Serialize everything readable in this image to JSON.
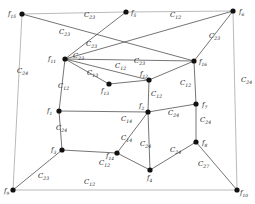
{
  "figure": {
    "kind": "graph-diagram",
    "background": "#ffffff",
    "node_color": "#111111",
    "edge_color": "#3a3a3a",
    "outer_edge_color": "#a8a8a8",
    "width": 255,
    "height": 204
  },
  "vertices": [
    {
      "id": "f15",
      "label": "f",
      "sub": "15",
      "x": 22,
      "y": 14,
      "lx": 8,
      "ly": 16
    },
    {
      "id": "f5",
      "label": "f",
      "sub": "5",
      "x": 126,
      "y": 12,
      "lx": 131,
      "ly": 15
    },
    {
      "id": "f6",
      "label": "f",
      "sub": "6",
      "x": 233,
      "y": 11,
      "lx": 239,
      "ly": 14
    },
    {
      "id": "f11",
      "label": "f",
      "sub": "11",
      "x": 65,
      "y": 59,
      "lx": 48,
      "ly": 61
    },
    {
      "id": "f16",
      "label": "f",
      "sub": "16",
      "x": 194,
      "y": 61,
      "lx": 199,
      "ly": 64
    },
    {
      "id": "f12",
      "label": "f",
      "sub": "12",
      "x": 149,
      "y": 80,
      "lx": 140,
      "ly": 76
    },
    {
      "id": "f13",
      "label": "f",
      "sub": "13",
      "x": 109,
      "y": 84,
      "lx": 101,
      "ly": 93
    },
    {
      "id": "f1",
      "label": "f",
      "sub": "1",
      "x": 59,
      "y": 111,
      "lx": 47,
      "ly": 113
    },
    {
      "id": "f2",
      "label": "f",
      "sub": "2",
      "x": 148,
      "y": 112,
      "lx": 139,
      "ly": 108
    },
    {
      "id": "f7",
      "label": "f",
      "sub": "7",
      "x": 196,
      "y": 104,
      "lx": 202,
      "ly": 107
    },
    {
      "id": "f3",
      "label": "f",
      "sub": "3",
      "x": 62,
      "y": 150,
      "lx": 51,
      "ly": 152
    },
    {
      "id": "f14",
      "label": "f",
      "sub": "14",
      "x": 117,
      "y": 153,
      "lx": 106,
      "ly": 158
    },
    {
      "id": "f8",
      "label": "f",
      "sub": "8",
      "x": 196,
      "y": 142,
      "lx": 202,
      "ly": 145
    },
    {
      "id": "f4",
      "label": "f",
      "sub": "4",
      "x": 150,
      "y": 170,
      "lx": 147,
      "ly": 180
    },
    {
      "id": "f9",
      "label": "f",
      "sub": "9",
      "x": 13,
      "y": 190,
      "lx": 4,
      "ly": 193
    },
    {
      "id": "f10",
      "label": "f",
      "sub": "10",
      "x": 237,
      "y": 190,
      "lx": 240,
      "ly": 195
    }
  ],
  "edges": [
    {
      "from": "f15",
      "to": "f5",
      "style": "light"
    },
    {
      "from": "f5",
      "to": "f6",
      "style": "light"
    },
    {
      "from": "f15",
      "to": "f9",
      "style": "light"
    },
    {
      "from": "f6",
      "to": "f10",
      "style": "light"
    },
    {
      "from": "f9",
      "to": "f10",
      "style": "light"
    },
    {
      "from": "f15",
      "to": "f16",
      "style": "normal"
    },
    {
      "from": "f11",
      "to": "f5",
      "style": "normal"
    },
    {
      "from": "f11",
      "to": "f6",
      "style": "normal"
    },
    {
      "from": "f11",
      "to": "f16",
      "style": "normal"
    },
    {
      "from": "f11",
      "to": "f12",
      "style": "normal"
    },
    {
      "from": "f11",
      "to": "f13",
      "style": "normal"
    },
    {
      "from": "f11",
      "to": "f1",
      "style": "normal"
    },
    {
      "from": "f16",
      "to": "f6",
      "style": "normal"
    },
    {
      "from": "f16",
      "to": "f7",
      "style": "normal"
    },
    {
      "from": "f12",
      "to": "f13",
      "style": "normal"
    },
    {
      "from": "f12",
      "to": "f16",
      "style": "normal"
    },
    {
      "from": "f12",
      "to": "f2",
      "style": "normal"
    },
    {
      "from": "f1",
      "to": "f2",
      "style": "normal"
    },
    {
      "from": "f1",
      "to": "f3",
      "style": "normal"
    },
    {
      "from": "f2",
      "to": "f7",
      "style": "normal"
    },
    {
      "from": "f2",
      "to": "f14",
      "style": "normal"
    },
    {
      "from": "f2",
      "to": "f4",
      "style": "normal"
    },
    {
      "from": "f7",
      "to": "f8",
      "style": "normal"
    },
    {
      "from": "f3",
      "to": "f14",
      "style": "normal"
    },
    {
      "from": "f3",
      "to": "f9",
      "style": "normal"
    },
    {
      "from": "f14",
      "to": "f4",
      "style": "normal"
    },
    {
      "from": "f4",
      "to": "f8",
      "style": "normal"
    },
    {
      "from": "f8",
      "to": "f10",
      "style": "normal"
    }
  ],
  "edge_labels": [
    {
      "id": "c23-top",
      "label": "C",
      "sub": "23",
      "x": 84,
      "y": 17
    },
    {
      "id": "c12-top",
      "label": "C",
      "sub": "12",
      "x": 170,
      "y": 17
    },
    {
      "id": "c23-f11f5",
      "label": "C",
      "sub": "23",
      "x": 59,
      "y": 34
    },
    {
      "id": "c23-diag",
      "label": "C",
      "sub": "23",
      "x": 86,
      "y": 46
    },
    {
      "id": "c23-f16f6",
      "label": "C",
      "sub": "23",
      "x": 209,
      "y": 38
    },
    {
      "id": "c24-left",
      "label": "C",
      "sub": "24",
      "x": 17,
      "y": 73
    },
    {
      "id": "c24-right",
      "label": "C",
      "sub": "24",
      "x": 241,
      "y": 82
    },
    {
      "id": "c23-f11f12",
      "label": "C",
      "sub": "23",
      "x": 73,
      "y": 58
    },
    {
      "id": "c12-f11f12",
      "label": "C",
      "sub": "12",
      "x": 115,
      "y": 68
    },
    {
      "id": "c23-f12b",
      "label": "C",
      "sub": "23",
      "x": 134,
      "y": 63
    },
    {
      "id": "c13-f11f13",
      "label": "C",
      "sub": "13",
      "x": 87,
      "y": 75
    },
    {
      "id": "c12-f11f1",
      "label": "C",
      "sub": "12",
      "x": 58,
      "y": 88
    },
    {
      "id": "c12-f16f7",
      "label": "C",
      "sub": "12",
      "x": 180,
      "y": 85
    },
    {
      "id": "c12-f12f2",
      "label": "C",
      "sub": "12",
      "x": 151,
      "y": 96
    },
    {
      "id": "c24-f1f3",
      "label": "C",
      "sub": "24",
      "x": 56,
      "y": 130
    },
    {
      "id": "c14-f2",
      "label": "C",
      "sub": "14",
      "x": 121,
      "y": 121
    },
    {
      "id": "c24-f2f7",
      "label": "C",
      "sub": "24",
      "x": 168,
      "y": 115
    },
    {
      "id": "c24-f7f8",
      "label": "C",
      "sub": "24",
      "x": 200,
      "y": 122
    },
    {
      "id": "c14-f14",
      "label": "C",
      "sub": "14",
      "x": 121,
      "y": 140
    },
    {
      "id": "c24-f2f4",
      "label": "C",
      "sub": "24",
      "x": 140,
      "y": 146
    },
    {
      "id": "c24-f4f8",
      "label": "C",
      "sub": "24",
      "x": 170,
      "y": 152
    },
    {
      "id": "c27-f8f10",
      "label": "C",
      "sub": "27",
      "x": 198,
      "y": 166
    },
    {
      "id": "c23-f3f9",
      "label": "C",
      "sub": "23",
      "x": 38,
      "y": 178
    },
    {
      "id": "c12-bottom",
      "label": "C",
      "sub": "12",
      "x": 84,
      "y": 184
    },
    {
      "id": "c12-f3f14",
      "label": "C",
      "sub": "12",
      "x": 99,
      "y": 165
    }
  ]
}
